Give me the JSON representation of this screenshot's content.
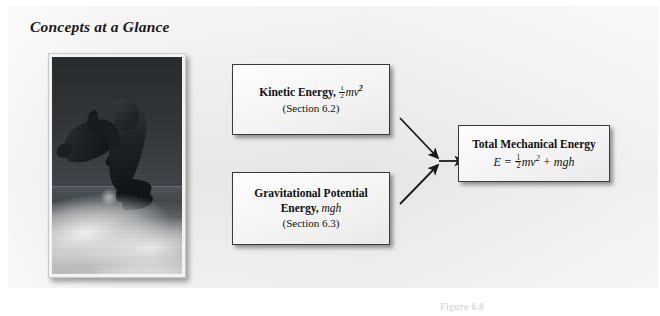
{
  "figure": {
    "title": "Concepts at a Glance",
    "background_color": "#ececec",
    "page_background": "#ffffff"
  },
  "photo": {
    "alt": "Two dolphins leaping out of the ocean above a boat wake",
    "subject": "dolphins",
    "palette": {
      "sky": "#2e3235",
      "sea": "#3b4146",
      "foam": "#ffffff",
      "dolphin": "#0f1316"
    }
  },
  "boxes": [
    {
      "id": "kinetic",
      "title_plain": "Kinetic Energy,",
      "formula_plain": "1/2 mv^2",
      "formula_var": "mv",
      "formula_exp": "2",
      "subtitle": "(Section 6.2)",
      "fraction": {
        "numerator": "1",
        "denominator": "2"
      }
    },
    {
      "id": "gravitational-potential",
      "title_line1": "Gravitational Potential",
      "title_line2": "Energy,",
      "formula_var": "mgh",
      "subtitle": "(Section 6.3)"
    },
    {
      "id": "total-mechanical",
      "title_plain": "Total Mechanical Energy",
      "formula_lead": "E =",
      "formula_var1": "mv",
      "formula_exp": "2",
      "formula_plus": "+",
      "formula_var2": "mgh",
      "fraction": {
        "numerator": "1",
        "denominator": "2"
      },
      "formula_plain": "E = 1/2 mv^2 + mgh"
    }
  ],
  "arrows": [
    {
      "name": "kinetic-to-junction",
      "from": "box-kinetic",
      "to": "junction"
    },
    {
      "name": "gpe-to-junction",
      "from": "box-gpe",
      "to": "junction"
    },
    {
      "name": "junction-to-total",
      "from": "junction",
      "to": "box-total"
    }
  ],
  "caption": {
    "number": "Figure 6.8",
    "text": ""
  }
}
